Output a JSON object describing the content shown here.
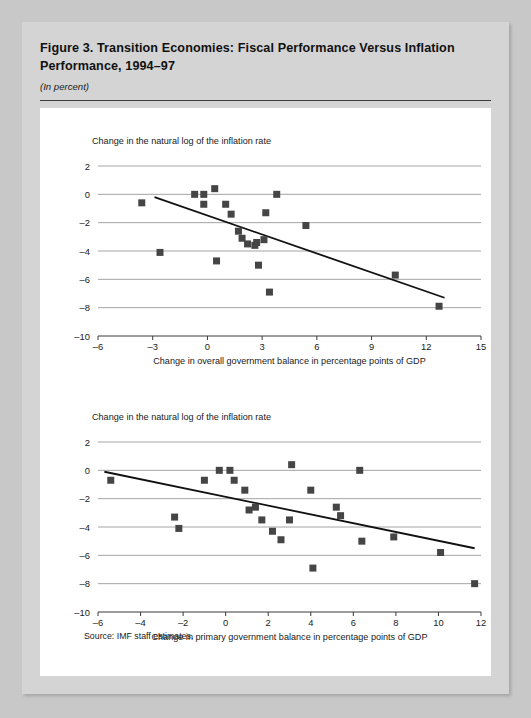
{
  "figure": {
    "title": "Figure 3.  Transition Economies:  Fiscal Performance Versus Inflation Performance, 1994–97",
    "subtitle": "(In percent)",
    "source": "Source:  IMF staff estimates."
  },
  "chart_data": [
    {
      "type": "scatter",
      "id": "top",
      "title": "",
      "ylabel": "Change in the natural log of the inflation rate",
      "xlabel": "Change in overall government balance in percentage points of GDP",
      "xlim": [
        -6,
        15
      ],
      "ylim": [
        -10,
        2
      ],
      "xticks": [
        -6,
        -3,
        0,
        3,
        6,
        9,
        12,
        15
      ],
      "xticklabels": [
        "–6",
        "–3",
        "0",
        "3",
        "6",
        "9",
        "12",
        "15"
      ],
      "yticks": [
        2,
        0,
        -2,
        -4,
        -6,
        -8,
        -10
      ],
      "yticklabels": [
        "2",
        "0",
        "–2",
        "–4",
        "–6",
        "–8",
        "–10"
      ],
      "grid": true,
      "legend": "none",
      "points": [
        {
          "x": -3.6,
          "y": -0.6
        },
        {
          "x": -2.6,
          "y": -4.1
        },
        {
          "x": -0.7,
          "y": 0.0
        },
        {
          "x": -0.2,
          "y": 0.0
        },
        {
          "x": -0.2,
          "y": -0.7
        },
        {
          "x": 0.4,
          "y": 0.4
        },
        {
          "x": 0.5,
          "y": -4.7
        },
        {
          "x": 1.0,
          "y": -0.7
        },
        {
          "x": 1.3,
          "y": -1.4
        },
        {
          "x": 1.7,
          "y": -2.6
        },
        {
          "x": 1.9,
          "y": -3.1
        },
        {
          "x": 2.2,
          "y": -3.5
        },
        {
          "x": 2.6,
          "y": -3.6
        },
        {
          "x": 2.7,
          "y": -3.4
        },
        {
          "x": 2.8,
          "y": -5.0
        },
        {
          "x": 3.1,
          "y": -3.2
        },
        {
          "x": 3.2,
          "y": -1.3
        },
        {
          "x": 3.4,
          "y": -6.9
        },
        {
          "x": 3.8,
          "y": 0.0
        },
        {
          "x": 5.4,
          "y": -2.2
        },
        {
          "x": 10.3,
          "y": -5.7
        },
        {
          "x": 12.7,
          "y": -7.9
        }
      ],
      "trendline": {
        "x1": -2.9,
        "y1": -0.2,
        "x2": 13.0,
        "y2": -7.3
      }
    },
    {
      "type": "scatter",
      "id": "bottom",
      "title": "",
      "ylabel": "Change in the natural log of the inflation rate",
      "xlabel": "Change in primary government balance in percentage points of GDP",
      "xlim": [
        -6,
        12
      ],
      "ylim": [
        -10,
        2
      ],
      "xticks": [
        -6,
        -4,
        -2,
        0,
        2,
        4,
        6,
        8,
        10,
        12
      ],
      "xticklabels": [
        "–6",
        "–4",
        "–2",
        "0",
        "2",
        "4",
        "6",
        "8",
        "10",
        "12"
      ],
      "yticks": [
        2,
        0,
        -2,
        -4,
        -6,
        -8,
        -10
      ],
      "yticklabels": [
        "2",
        "0",
        "–2",
        "–4",
        "–6",
        "–8",
        "–10"
      ],
      "grid": true,
      "legend": "none",
      "points": [
        {
          "x": -5.4,
          "y": -0.7
        },
        {
          "x": -2.4,
          "y": -3.3
        },
        {
          "x": -2.2,
          "y": -4.1
        },
        {
          "x": -1.0,
          "y": -0.7
        },
        {
          "x": -0.3,
          "y": 0.0
        },
        {
          "x": 0.2,
          "y": 0.0
        },
        {
          "x": 0.4,
          "y": -0.7
        },
        {
          "x": 0.9,
          "y": -1.4
        },
        {
          "x": 1.1,
          "y": -2.8
        },
        {
          "x": 1.4,
          "y": -2.6
        },
        {
          "x": 1.7,
          "y": -3.5
        },
        {
          "x": 2.2,
          "y": -4.3
        },
        {
          "x": 2.6,
          "y": -4.9
        },
        {
          "x": 3.0,
          "y": -3.5
        },
        {
          "x": 3.1,
          "y": 0.4
        },
        {
          "x": 4.0,
          "y": -1.4
        },
        {
          "x": 4.1,
          "y": -6.9
        },
        {
          "x": 5.2,
          "y": -2.6
        },
        {
          "x": 5.4,
          "y": -3.2
        },
        {
          "x": 6.3,
          "y": 0.0
        },
        {
          "x": 6.4,
          "y": -5.0
        },
        {
          "x": 7.9,
          "y": -4.7
        },
        {
          "x": 10.1,
          "y": -5.8
        },
        {
          "x": 11.7,
          "y": -8.0
        }
      ],
      "trendline": {
        "x1": -5.7,
        "y1": -0.1,
        "x2": 11.7,
        "y2": -5.5
      }
    }
  ]
}
